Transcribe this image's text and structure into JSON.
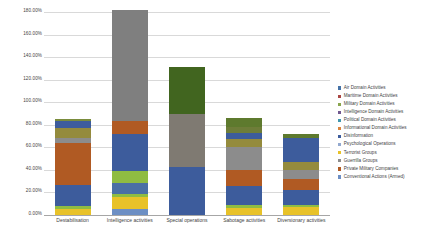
{
  "chart_data": {
    "type": "bar",
    "stacked": true,
    "title": "",
    "xlabel": "",
    "ylabel": "",
    "ylim": [
      0,
      180
    ],
    "ytick_labels": [
      "180.00%",
      "160.00%",
      "140.00%",
      "120.00%",
      "100.00%",
      "80.00%",
      "60.00%",
      "40.00%",
      "20.00%",
      "0.00%"
    ],
    "ytick_values": [
      180,
      160,
      140,
      120,
      100,
      80,
      60,
      40,
      20,
      0
    ],
    "grid": true,
    "legend_position": "right",
    "categories": [
      "Destabilisation",
      "Intelligence activities",
      "Special operations",
      "Sabotage activities",
      "Diversionary activities"
    ],
    "series": [
      {
        "name": "Air Domain Activities",
        "color": "#4572a7",
        "values": [
          0,
          0,
          0,
          0,
          0
        ]
      },
      {
        "name": "Maritime Domain Activities",
        "color": "#aa4643",
        "values": [
          0,
          0,
          0,
          2,
          0
        ]
      },
      {
        "name": "Military Domain Activities",
        "color": "#89a54e",
        "values": [
          3,
          0,
          0,
          3,
          3
        ]
      },
      {
        "name": "Intelligence Domain Activities",
        "color": "#71588f",
        "values": [
          0,
          0,
          0,
          0,
          0
        ]
      },
      {
        "name": "Political Domain Activities",
        "color": "#4198af",
        "values": [
          0,
          0,
          0,
          0,
          0
        ]
      },
      {
        "name": "Informational Domain Activities",
        "color": "#db843d",
        "values": [
          0,
          3,
          0,
          3,
          0
        ]
      },
      {
        "name": "Disinformation",
        "color": "#3d5c9c",
        "values": [
          9,
          0,
          0,
          5,
          18
        ]
      },
      {
        "name": "Psychological Operations",
        "color": "#93a9cf",
        "values": [
          0,
          0,
          0,
          0,
          0
        ]
      },
      {
        "name": "Terrorist Groups",
        "color": "#948b3d",
        "values": [
          8,
          0,
          0,
          7,
          7
        ]
      },
      {
        "name": "Guerrilla Groups",
        "color": "#7f7f7f",
        "values": [
          4,
          108,
          55,
          18,
          9
        ]
      },
      {
        "name": "Private Military Companies",
        "color": "#b05a23",
        "values": [
          28,
          6,
          0,
          11,
          9
        ]
      },
      {
        "name": "Conventional Actions (Armed)",
        "color": "#4a6fa5",
        "values": [
          0,
          0,
          0,
          0,
          0
        ]
      }
    ],
    "stack_order_note": "bars are drawn bottom-up from explicit segment lists",
    "bars": [
      {
        "category": "Destabilisation",
        "total": 85,
        "segments": [
          {
            "series": "Terrorist Groups",
            "color": "#e8c229",
            "value": 5
          },
          {
            "series": "Military Domain Activities",
            "color": "#8fbc42",
            "value": 3
          },
          {
            "series": "Disinformation",
            "color": "#3d5c9c",
            "value": 19
          },
          {
            "series": "Private Military Companies",
            "color": "#b05a23",
            "value": 37
          },
          {
            "series": "Guerrilla Groups",
            "color": "#8c8c8c",
            "value": 4
          },
          {
            "series": "Terrorist Groups",
            "color": "#948b3d",
            "value": 9
          },
          {
            "series": "Disinformation",
            "color": "#3d5c9c",
            "value": 6
          },
          {
            "series": "Military Domain Activities",
            "color": "#7a8c3c",
            "value": 2
          }
        ]
      },
      {
        "category": "Intelligence activities",
        "total": 182,
        "segments": [
          {
            "series": "Conventional Actions (Armed)",
            "color": "#6d8fc4",
            "value": 5
          },
          {
            "series": "Terrorist Groups",
            "color": "#e8c229",
            "value": 11
          },
          {
            "series": "Military Domain Activities",
            "color": "#8fbc42",
            "value": 3
          },
          {
            "series": "Disinformation",
            "color": "#4a6fa5",
            "value": 9
          },
          {
            "series": "Military Domain Activities",
            "color": "#8fbc42",
            "value": 11
          },
          {
            "series": "Disinformation",
            "color": "#3d5c9c",
            "value": 33
          },
          {
            "series": "Private Military Companies",
            "color": "#b05a23",
            "value": 11
          },
          {
            "series": "Guerrilla Groups",
            "color": "#7f7f7f",
            "value": 99
          }
        ]
      },
      {
        "category": "Special operations",
        "total": 131,
        "segments": [
          {
            "series": "Disinformation",
            "color": "#3d5c9c",
            "value": 43
          },
          {
            "series": "Guerrilla Groups",
            "color": "#7f7a72",
            "value": 47
          },
          {
            "series": "Military Domain Activities",
            "color": "#41651f",
            "value": 41
          }
        ]
      },
      {
        "category": "Sabotage activities",
        "total": 86,
        "segments": [
          {
            "series": "Terrorist Groups",
            "color": "#e8c229",
            "value": 6
          },
          {
            "series": "Military Domain Activities",
            "color": "#8fbc42",
            "value": 3
          },
          {
            "series": "Disinformation",
            "color": "#3d5c9c",
            "value": 17
          },
          {
            "series": "Private Military Companies",
            "color": "#b05a23",
            "value": 14
          },
          {
            "series": "Guerrilla Groups",
            "color": "#8c8c8c",
            "value": 20
          },
          {
            "series": "Terrorist Groups",
            "color": "#948b3d",
            "value": 7
          },
          {
            "series": "Disinformation",
            "color": "#3d5c9c",
            "value": 6
          },
          {
            "series": "Informational Domain Activities",
            "color": "#6e7d39",
            "value": 5
          },
          {
            "series": "Military Domain Activities",
            "color": "#5e7a2e",
            "value": 8
          }
        ]
      },
      {
        "category": "Diversionary activities",
        "total": 72,
        "segments": [
          {
            "series": "Terrorist Groups",
            "color": "#e8c229",
            "value": 7
          },
          {
            "series": "Military Domain Activities",
            "color": "#8fbc42",
            "value": 2
          },
          {
            "series": "Disinformation",
            "color": "#3d5c9c",
            "value": 13
          },
          {
            "series": "Private Military Companies",
            "color": "#b05a23",
            "value": 10
          },
          {
            "series": "Guerrilla Groups",
            "color": "#8c8c8c",
            "value": 8
          },
          {
            "series": "Terrorist Groups",
            "color": "#948b3d",
            "value": 7
          },
          {
            "series": "Disinformation",
            "color": "#3d5c9c",
            "value": 21
          },
          {
            "series": "Military Domain Activities",
            "color": "#5e7a2e",
            "value": 4
          }
        ]
      }
    ],
    "legend_entries": [
      {
        "label": "Air Domain Activities",
        "color": "#4572a7"
      },
      {
        "label": "Maritime Domain Activities",
        "color": "#aa4643"
      },
      {
        "label": "Military Domain Activities",
        "color": "#89a54e"
      },
      {
        "label": "Intelligence Domain Activities",
        "color": "#71588f"
      },
      {
        "label": "Political Domain Activities",
        "color": "#4198af"
      },
      {
        "label": "Informational Domain Activities",
        "color": "#db843d"
      },
      {
        "label": "Disinformation",
        "color": "#3d5c9c"
      },
      {
        "label": "Psychological Operations",
        "color": "#93a9cf"
      },
      {
        "label": "Terrorist Groups",
        "color": "#e8c229"
      },
      {
        "label": "Guerrilla Groups",
        "color": "#8c8c8c"
      },
      {
        "label": "Private Military Companies",
        "color": "#b05a23"
      },
      {
        "label": "Conventional Actions (Armed)",
        "color": "#6d8fc4"
      }
    ]
  }
}
